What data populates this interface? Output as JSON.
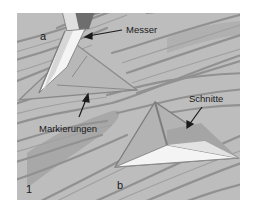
{
  "figure": {
    "number": "1",
    "labels": {
      "knife": "Messer",
      "cuts": "Schnitte",
      "markings": "Markierungen"
    },
    "subfigures": [
      "a",
      "b"
    ]
  },
  "colors": {
    "wood_base": "#bdbdbd",
    "grain_line": "#8f8f8f",
    "grain_dark": "#9a9a9a",
    "cut_face_light": "#f4f4f4",
    "cut_edge": "#7d7d7d",
    "knife_handle": "#6a6a6a",
    "text": "#1a1a1a"
  }
}
